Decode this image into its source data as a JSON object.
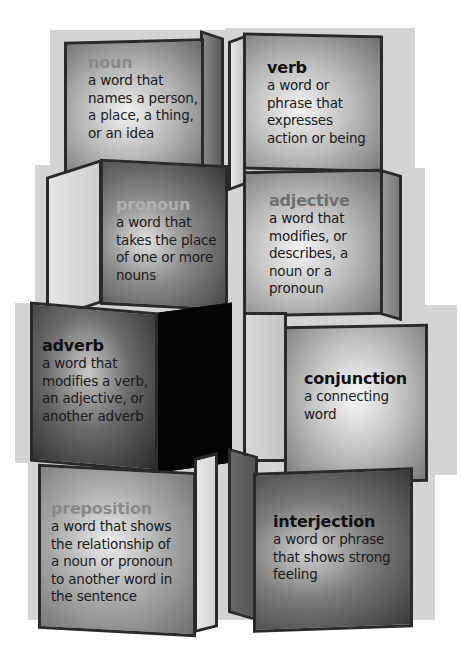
{
  "colors": {
    "background": "#ffffff",
    "box_outline": "#2a2a2a",
    "term_dark": "#1a1a1a",
    "term_faded": "#7a7a7a",
    "term_faded_light": "#a8a8a8"
  },
  "blocks": [
    {
      "id": "noun",
      "term": "noun",
      "definition": "a word that\nnames a person,\na place, a thing,\nor an idea",
      "term_style": "faded"
    },
    {
      "id": "verb",
      "term": "verb",
      "definition": "a word or\nphrase that\nexpresses\naction or being",
      "term_style": "dark"
    },
    {
      "id": "pronoun",
      "term": "pronoun",
      "definition": "a word that\ntakes the place\nof one or more\nnouns",
      "term_style": "faded-light"
    },
    {
      "id": "adjective",
      "term": "adjective",
      "definition": "a word that\nmodifies, or\ndescribes, a\nnoun or a\npronoun",
      "term_style": "faded"
    },
    {
      "id": "adverb",
      "term": "adverb",
      "definition": "a word that\nmodifies a verb,\nan adjective, or\nanother adverb",
      "term_style": "dark"
    },
    {
      "id": "conjunction",
      "term": "conjunction",
      "definition": "a connecting\nword",
      "term_style": "dark"
    },
    {
      "id": "preposition",
      "term": "preposition",
      "definition": "a word that shows\nthe relationship of\na noun or pronoun\nto another word in\nthe sentence",
      "term_style": "faded"
    },
    {
      "id": "interjection",
      "term": "interjection",
      "definition": "a word or phrase\nthat shows strong\nfeeling",
      "term_style": "dark"
    }
  ]
}
